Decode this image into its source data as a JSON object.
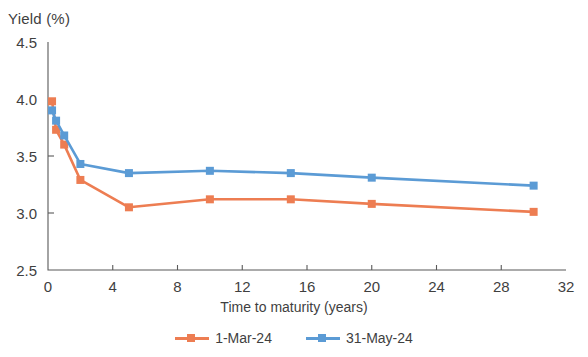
{
  "chart_data": {
    "type": "line",
    "title": "",
    "xlabel": "Time to maturity (years)",
    "ylabel": "Yield (%)",
    "xlim": [
      0,
      32
    ],
    "ylim": [
      2.5,
      4.5
    ],
    "xticks": [
      0,
      4,
      8,
      12,
      16,
      20,
      24,
      28,
      32
    ],
    "xtick_labels": [
      "0",
      "4",
      "8",
      "12",
      "16",
      "20",
      "24",
      "28",
      "32"
    ],
    "yticks": [
      2.5,
      3.0,
      3.5,
      4.0,
      4.5
    ],
    "ytick_labels": [
      "2.5",
      "3.0",
      "3.5",
      "4.0",
      "4.5"
    ],
    "grid": false,
    "legend_position": "bottom",
    "x": [
      0.25,
      0.5,
      1,
      2,
      5,
      10,
      15,
      20,
      30
    ],
    "series": [
      {
        "name": "1-Mar-24",
        "color": "#ED7D52",
        "marker": "square",
        "values": [
          3.98,
          3.73,
          3.6,
          3.29,
          3.05,
          3.12,
          3.12,
          3.08,
          3.01
        ]
      },
      {
        "name": "31-May-24",
        "color": "#5B9BD5",
        "marker": "square",
        "values": [
          3.9,
          3.81,
          3.68,
          3.43,
          3.35,
          3.37,
          3.35,
          3.31,
          3.24
        ]
      }
    ]
  },
  "legend": {
    "items": [
      {
        "label": "1-Mar-24",
        "color": "#ED7D52"
      },
      {
        "label": "31-May-24",
        "color": "#5B9BD5"
      }
    ]
  }
}
